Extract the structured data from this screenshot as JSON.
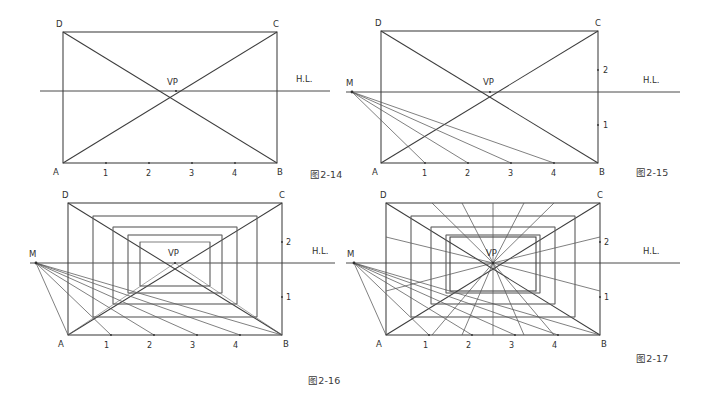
{
  "page": {
    "width": 705,
    "height": 399,
    "background": "#ffffff",
    "ink_color": "#3d3d3d"
  },
  "figures": [
    {
      "id": "fig-2-14",
      "caption": "图2-14",
      "labels": {
        "corner_a": "A",
        "corner_b": "B",
        "corner_c": "C",
        "corner_d": "D",
        "vanishing_point": "VP",
        "horizon_line": "H.L."
      },
      "baseline_ticks": [
        "1",
        "2",
        "3",
        "4"
      ],
      "right_edge_ticks": [],
      "has_measuring_point": false,
      "measuring_point_label": ""
    },
    {
      "id": "fig-2-15",
      "caption": "图2-15",
      "labels": {
        "corner_a": "A",
        "corner_b": "B",
        "corner_c": "C",
        "corner_d": "D",
        "vanishing_point": "VP",
        "horizon_line": "H.L.",
        "measuring_point": "M"
      },
      "baseline_ticks": [
        "1",
        "2",
        "3",
        "4"
      ],
      "right_edge_ticks": [
        "2",
        "1"
      ],
      "has_measuring_point": true,
      "measuring_point_label": "M"
    },
    {
      "id": "fig-2-16",
      "caption": "图2-16",
      "labels": {
        "corner_a": "A",
        "corner_b": "B",
        "corner_c": "C",
        "corner_d": "D",
        "vanishing_point": "VP",
        "horizon_line": "H.L.",
        "measuring_point": "M"
      },
      "baseline_ticks": [
        "1",
        "2",
        "3",
        "4"
      ],
      "right_edge_ticks": [
        "2",
        "1"
      ],
      "has_measuring_point": true,
      "measuring_point_label": "M"
    },
    {
      "id": "fig-2-17",
      "caption": "图2-17",
      "labels": {
        "corner_a": "A",
        "corner_b": "B",
        "corner_c": "C",
        "corner_d": "D",
        "vanishing_point": "VP",
        "horizon_line": "H.L.",
        "measuring_point": "M"
      },
      "baseline_ticks": [
        "1",
        "2",
        "3",
        "4"
      ],
      "right_edge_ticks": [
        "2",
        "1"
      ],
      "has_measuring_point": true,
      "measuring_point_label": "M"
    }
  ]
}
